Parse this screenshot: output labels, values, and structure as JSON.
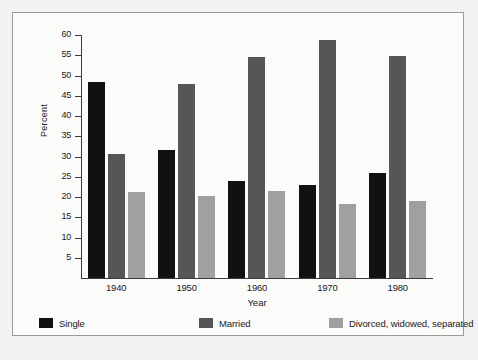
{
  "chart_data": {
    "type": "bar",
    "title": "",
    "subtitle": "",
    "xlabel": "Year",
    "ylabel": "Percent",
    "categories": [
      "1940",
      "1950",
      "1960",
      "1970",
      "1980"
    ],
    "series": [
      {
        "name": "Single",
        "color": "#111111",
        "values": [
          48.5,
          31.6,
          23.9,
          22.9,
          26.0
        ]
      },
      {
        "name": "Married",
        "color": "#565656",
        "values": [
          30.5,
          48.0,
          54.6,
          58.8,
          54.8
        ]
      },
      {
        "name": "Divorced, widowed, separated",
        "color": "#a0a0a0",
        "values": [
          21.2,
          20.3,
          21.5,
          18.2,
          18.9
        ]
      }
    ],
    "ylim": [
      0,
      60
    ],
    "yticks": [
      5,
      10,
      15,
      20,
      25,
      30,
      35,
      40,
      45,
      50,
      55,
      60
    ],
    "ytick_labels": [
      "5",
      "10",
      "15",
      "20",
      "25",
      "30",
      "35",
      "40",
      "45",
      "50",
      "55",
      "60"
    ],
    "grid": false,
    "legend_position": "bottom"
  },
  "legend": {
    "items": [
      {
        "label": "Single"
      },
      {
        "label": "Married"
      },
      {
        "label": "Divorced, widowed, separated"
      }
    ]
  },
  "axes": {
    "y_title": "Percent",
    "x_title": "Year"
  }
}
